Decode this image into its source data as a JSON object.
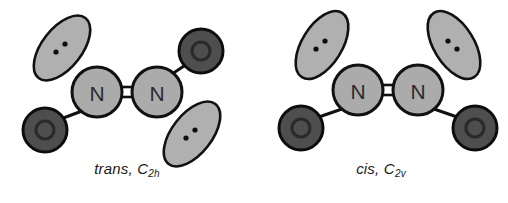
{
  "figure": {
    "background_color": "#ffffff",
    "width": 508,
    "height": 203
  },
  "palette": {
    "nitrogen_fill": "#ababab",
    "nitrogen_stroke": "#111111",
    "oxygen_fill": "#4e4e4e",
    "oxygen_inner_ring": "#2e2e2e",
    "oxygen_stroke": "#0d0d0d",
    "lobe_fill": "#b0b0b0",
    "lobe_stroke": "#111111",
    "bond_stroke": "#111111",
    "dot_fill": "#0d0d0d",
    "text_color": "#1a1a1a"
  },
  "structures": [
    {
      "id": "trans",
      "caption_text": "trans,",
      "caption_symbol": "C",
      "caption_subscript": "2h",
      "caption_full": "trans, C2h",
      "atoms": [
        {
          "element": "N",
          "label": "N",
          "x": 97,
          "y": 92,
          "r": 25
        },
        {
          "element": "N",
          "label": "N",
          "x": 157,
          "y": 92,
          "r": 25
        },
        {
          "element": "O",
          "label": "O",
          "x": 45,
          "y": 130,
          "r": 22
        },
        {
          "element": "O",
          "label": "O",
          "x": 201,
          "y": 51,
          "r": 22
        }
      ],
      "bonds": [
        {
          "from": "N1",
          "to": "N2",
          "order": 2,
          "x1": 122,
          "y1": 92,
          "x2": 132,
          "y2": 92
        },
        {
          "from": "N1",
          "to": "O1",
          "order": 1,
          "x1": 80,
          "y1": 110,
          "x2": 61,
          "y2": 118
        },
        {
          "from": "N2",
          "to": "O2",
          "order": 1,
          "x1": 175,
          "y1": 76,
          "x2": 188,
          "y2": 64
        }
      ],
      "lone_pairs": [
        {
          "on": "N1",
          "cx": 62,
          "cy": 48,
          "rx": 38,
          "ry": 20,
          "rotation": -52,
          "dots": 2
        },
        {
          "on": "N2",
          "cx": 192,
          "cy": 134,
          "rx": 38,
          "ry": 20,
          "rotation": -52,
          "dots": 2
        }
      ]
    },
    {
      "id": "cis",
      "caption_text": "cis,",
      "caption_symbol": "C",
      "caption_subscript": "2v",
      "caption_full": "cis, C2v",
      "atoms": [
        {
          "element": "N",
          "label": "N",
          "x": 104,
          "y": 90,
          "r": 25
        },
        {
          "element": "N",
          "label": "N",
          "x": 164,
          "y": 90,
          "r": 25
        },
        {
          "element": "O",
          "label": "O",
          "x": 47,
          "y": 128,
          "r": 22
        },
        {
          "element": "O",
          "label": "O",
          "x": 221,
          "y": 128,
          "r": 22
        }
      ],
      "bonds": [
        {
          "from": "N1",
          "to": "N2",
          "order": 2,
          "x1": 129,
          "y1": 90,
          "x2": 139,
          "y2": 90
        },
        {
          "from": "N1",
          "to": "O1",
          "order": 1,
          "x1": 86,
          "y1": 108,
          "x2": 64,
          "y2": 116
        },
        {
          "from": "N2",
          "to": "O2",
          "order": 1,
          "x1": 182,
          "y1": 108,
          "x2": 204,
          "y2": 116
        }
      ],
      "lone_pairs": [
        {
          "on": "N1",
          "cx": 68,
          "cy": 45,
          "rx": 38,
          "ry": 20,
          "rotation": -58,
          "dots": 2
        },
        {
          "on": "N2",
          "cx": 200,
          "cy": 45,
          "rx": 38,
          "ry": 20,
          "rotation": 58,
          "dots": 2
        }
      ]
    }
  ]
}
